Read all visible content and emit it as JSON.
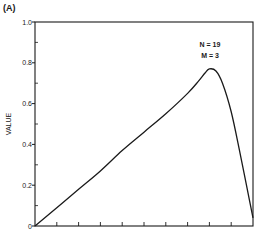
{
  "panel_label": "(A)",
  "chart_data": {
    "type": "line",
    "title": "",
    "xlabel": "",
    "ylabel": "VALUE",
    "xlim": [
      0,
      1
    ],
    "ylim": [
      0,
      1.0
    ],
    "x_ticks": 10,
    "y_ticks": [
      0,
      0.2,
      0.4,
      0.6,
      0.8,
      1.0
    ],
    "y_tick_labels": [
      "0",
      "0.2",
      "0.4",
      "0.6",
      "0.8",
      "1.0"
    ],
    "y_minor_ticks": [
      0.1,
      0.3,
      0.5,
      0.7,
      0.9
    ],
    "grid": false,
    "annotations": [
      "N = 19",
      "M = 3"
    ],
    "series": [
      {
        "name": "value",
        "x": [
          0,
          0.1,
          0.2,
          0.3,
          0.4,
          0.5,
          0.6,
          0.7,
          0.75,
          0.78,
          0.8,
          0.83,
          0.86,
          0.9,
          0.94,
          0.97,
          1.0
        ],
        "values": [
          0,
          0.09,
          0.18,
          0.27,
          0.37,
          0.46,
          0.55,
          0.65,
          0.71,
          0.75,
          0.77,
          0.76,
          0.7,
          0.56,
          0.36,
          0.2,
          0.04
        ]
      }
    ]
  },
  "colors": {
    "ink": "#1a1a1a",
    "background": "#ffffff"
  }
}
